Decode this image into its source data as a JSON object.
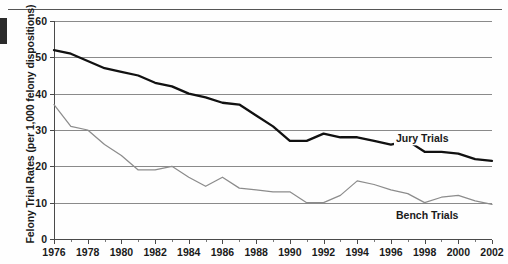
{
  "chart_data": {
    "type": "line",
    "title": "",
    "xlabel": "",
    "ylabel": "Felony Trial Rates (per 1,000 felony dispositions)",
    "xlim": [
      1976,
      2002
    ],
    "ylim": [
      0,
      60
    ],
    "yticks": [
      0,
      10,
      20,
      30,
      40,
      50,
      60
    ],
    "ytick_labels": [
      "0",
      "10",
      "20",
      "30",
      "40",
      "50",
      "60"
    ],
    "xticks": [
      1976,
      1978,
      1980,
      1982,
      1984,
      1986,
      1988,
      1990,
      1992,
      1994,
      1996,
      1998,
      2000,
      2002
    ],
    "xtick_labels": [
      "1976",
      "1978",
      "1980",
      "1982",
      "1984",
      "1986",
      "1988",
      "1990",
      "1992",
      "1994",
      "1996",
      "1998",
      "2000",
      "2002"
    ],
    "x": [
      1976,
      1977,
      1978,
      1979,
      1980,
      1981,
      1982,
      1983,
      1984,
      1985,
      1986,
      1987,
      1988,
      1989,
      1990,
      1991,
      1992,
      1993,
      1994,
      1995,
      1996,
      1997,
      1998,
      1999,
      2000,
      2001,
      2002
    ],
    "grid": "horizontal",
    "legend_position": "inline-right",
    "series": [
      {
        "name": "Jury Trials",
        "color": "#111111",
        "label_x": 1996.3,
        "label_y": 27.6,
        "values": [
          52,
          51,
          49,
          47,
          46,
          45,
          43,
          42,
          40,
          39,
          37.5,
          37,
          34,
          31,
          27,
          27,
          29,
          28,
          28,
          27,
          26,
          27,
          24,
          24,
          23.5,
          22,
          21.5
        ]
      },
      {
        "name": "Bench Trials",
        "color": "#8c8c8c",
        "label_x": 1996.3,
        "label_y": 6.6,
        "values": [
          37,
          31,
          30,
          26,
          23,
          19,
          19,
          20,
          17,
          14.5,
          17,
          14,
          13.5,
          13,
          13,
          10,
          10,
          12,
          16,
          15,
          13.5,
          12.5,
          10,
          11.5,
          12,
          10.5,
          9.5
        ]
      }
    ]
  }
}
